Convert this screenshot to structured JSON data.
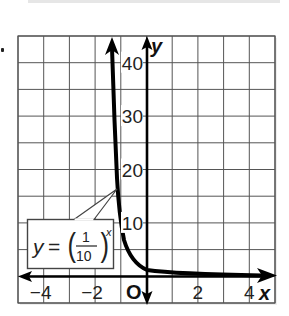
{
  "problem_marker": "•",
  "chart_data": {
    "type": "line",
    "title": "",
    "function_label": {
      "lhs": "y",
      "equals": "=",
      "numerator": "1",
      "denominator": "10",
      "exponent": "x",
      "full": "y = (1/10)^x"
    },
    "xlabel": "x",
    "ylabel": "y",
    "origin_label": "O",
    "xlim": [
      -5,
      5
    ],
    "ylim": [
      -5,
      45
    ],
    "x_ticks": [
      {
        "value": -4,
        "label": "−4"
      },
      {
        "value": -2,
        "label": "−2"
      },
      {
        "value": 2,
        "label": "2"
      },
      {
        "value": 4,
        "label": "4"
      }
    ],
    "y_ticks": [
      {
        "value": 10,
        "label": "10"
      },
      {
        "value": 20,
        "label": "20"
      },
      {
        "value": 30,
        "label": "30"
      },
      {
        "value": 40,
        "label": "40"
      }
    ],
    "grid": true,
    "grid_x_step": 1,
    "grid_y_step": 5,
    "series": [
      {
        "name": "y = (1/10)^x",
        "x": [
          -1.36,
          -1.28,
          -1.2,
          -1.1,
          -1.0,
          -0.8,
          -0.6,
          -0.4,
          -0.2,
          0,
          0.5,
          1,
          2,
          3,
          4,
          5
        ],
        "y": [
          45,
          30,
          20,
          15.5,
          10,
          6.3,
          4.0,
          2.5,
          1.6,
          1.0,
          0.6,
          0.4,
          0.2,
          0.1,
          0.05,
          0.02
        ]
      }
    ],
    "colors": {
      "curve": "#000000",
      "grid": "#555555",
      "axes": "#000000",
      "label_box_border": "#444444"
    }
  }
}
